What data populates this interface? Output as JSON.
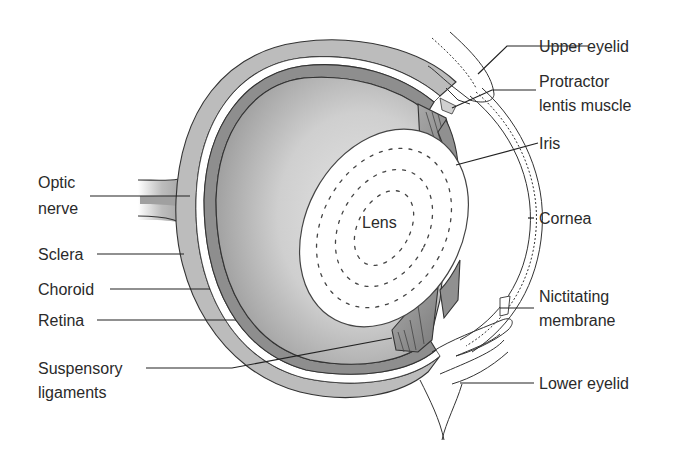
{
  "diagram": {
    "center_label": "Lens",
    "labels": {
      "optic_nerve": [
        "Optic",
        "nerve"
      ],
      "sclera": "Sclera",
      "choroid": "Choroid",
      "retina": "Retina",
      "suspensory_ligaments": [
        "Suspensory",
        "ligaments"
      ],
      "upper_eyelid": "Upper eyelid",
      "protractor_lentis_muscle": [
        "Protractor",
        "lentis muscle"
      ],
      "iris": "Iris",
      "cornea": "Cornea",
      "nictitating_membrane": [
        "Nictitating",
        "membrane"
      ],
      "lower_eyelid": "Lower eyelid"
    },
    "colors": {
      "background": "#ffffff",
      "sclera": "#bdbdbd",
      "choroid": "#8c8c8c",
      "vitreous_light": "#d6d6d6",
      "vitreous_dark": "#9a9a9a",
      "lens": "#ffffff",
      "text": "#2a2a2a"
    }
  }
}
